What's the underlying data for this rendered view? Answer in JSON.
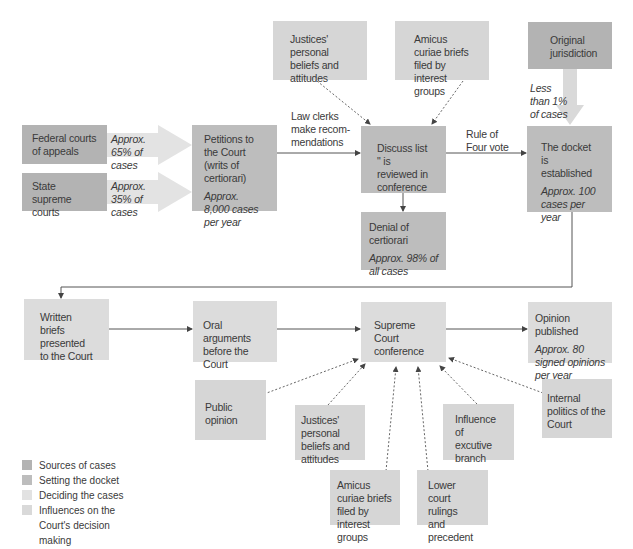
{
  "colors": {
    "sources": "#b3b3b3",
    "docket": "#bdbdbd",
    "deciding": "#dcdcdc",
    "influences": "#d6d6d6",
    "line": "#555555"
  },
  "nodes": {
    "federal_courts": "Federal courts of appeals",
    "state_courts": "State supreme courts",
    "federal_share": "Approx. 65% of cases",
    "state_share": "Approx. 35% of cases",
    "petitions": {
      "title": "Petitions to the Court (writs of certiorari)",
      "note": "Approx. 8,000 cases per year"
    },
    "justices_top": "Justices' personal beliefs and attitudes",
    "amicus_top": "Amicus curiae briefs filed by interest groups",
    "law_clerks": "Law clerks make recom- mendations",
    "discuss_list": "Discuss list \" is reviewed in conference",
    "denial": {
      "title": "Denial of certiorari",
      "note": "Approx. 98% of all cases"
    },
    "rule_of_four": "Rule of Four vote",
    "original_jurisdiction": "Original jurisdiction",
    "original_share": "Less than 1% of cases",
    "docket": {
      "title": "The docket is established",
      "note": "Approx. 100 cases per year"
    },
    "written_briefs": "Written briefs presented to the Court",
    "oral_arguments": "Oral arguments before the Court",
    "conference": "Supreme Court conference",
    "opinion": {
      "title": "Opinion published",
      "note": "Approx. 80 signed opinions per year"
    },
    "public_opinion": "Public opinion",
    "justices_bottom": "Justices' personal beliefs and attitudes",
    "amicus_bottom": "Amicus curiae briefs filed by interest groups",
    "lower_court": "Lower court rulings and precedent",
    "executive": "Influence of excutive branch",
    "internal_politics": "Internal politics of the Court"
  },
  "legend": [
    {
      "label": "Sources of cases",
      "color": "#b3b3b3"
    },
    {
      "label": "Setting the docket",
      "color": "#bdbdbd"
    },
    {
      "label": "Deciding the cases",
      "color": "#e2e2e2"
    },
    {
      "label": "Influences on the Court's decision making",
      "color": "#d9d9d9"
    }
  ]
}
